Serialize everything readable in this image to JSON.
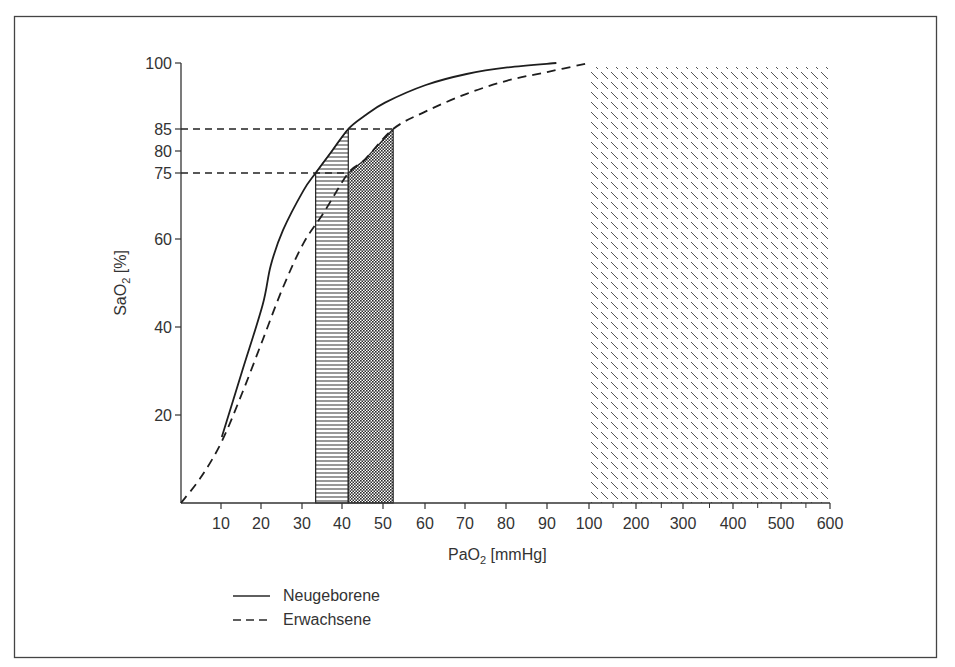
{
  "chart_data": {
    "type": "line",
    "title": "",
    "xlabel": "PaO2 [mmHg]",
    "xlabel_main": "PaO",
    "xlabel_sub": "2",
    "xlabel_unit": " [mmHg]",
    "ylabel": "SaO2 [%]",
    "ylabel_main": "SaO",
    "ylabel_sub": "2",
    "ylabel_unit": " [%]",
    "x_scale_note": "linear 0-100, then compressed 100-600",
    "x_ticks": [
      "10",
      "20",
      "30",
      "40",
      "50",
      "60",
      "70",
      "80",
      "90",
      "100",
      "200",
      "300",
      "400",
      "500",
      "600"
    ],
    "y_ticks": [
      "20",
      "40",
      "60",
      "75",
      "80",
      "85",
      "100"
    ],
    "ylim": [
      0,
      100
    ],
    "grid": false,
    "legend_position": "bottom-left",
    "series": [
      {
        "name": "Neugeborene",
        "style": "solid",
        "x": [
          10,
          15,
          20,
          22,
          25,
          30,
          33,
          37,
          41,
          45,
          50,
          60,
          70,
          80,
          92
        ],
        "y": [
          15,
          30,
          45,
          54,
          62,
          71,
          75,
          80,
          85,
          88,
          91,
          95,
          97.5,
          99,
          100
        ]
      },
      {
        "name": "Erwachsene",
        "style": "dashed",
        "x": [
          0,
          5,
          10,
          15,
          20,
          25,
          30,
          35,
          41,
          45,
          52,
          60,
          70,
          80,
          90,
          100
        ],
        "y": [
          0,
          6,
          14,
          25,
          37,
          49,
          59,
          66,
          75,
          78,
          85,
          89,
          93,
          96,
          98,
          100
        ]
      }
    ],
    "reference_lines": [
      {
        "axis": "y",
        "value": 85,
        "style": "dashed",
        "x_to": 52
      },
      {
        "axis": "y",
        "value": 75,
        "style": "dashed",
        "x_to": 41
      }
    ],
    "shaded_regions": [
      {
        "name": "newborn-target-range",
        "pattern": "horizontal-lines",
        "x_from": 33,
        "x_to": 41,
        "bounded_by": "Neugeborene curve",
        "y_range": [
          75,
          85
        ]
      },
      {
        "name": "adult-target-range",
        "pattern": "crosshatch-dots",
        "x_from": 41,
        "x_to": 52,
        "bounded_by": "Erwachsene curve",
        "y_range": [
          75,
          85
        ]
      },
      {
        "name": "hyperoxia-range",
        "pattern": "diagonal-dashes",
        "x_from": 100,
        "x_to": 600,
        "y_range": [
          0,
          100
        ]
      }
    ]
  },
  "legend": {
    "items": [
      {
        "label": "Neugeborene",
        "style": "solid"
      },
      {
        "label": "Erwachsene",
        "style": "dashed"
      }
    ]
  }
}
